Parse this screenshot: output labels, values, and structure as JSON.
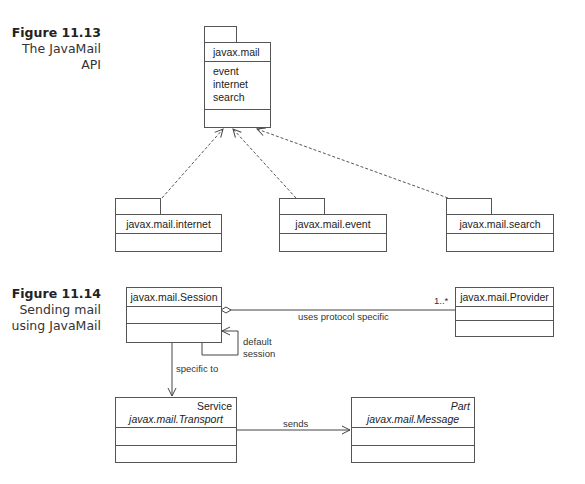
{
  "figures": [
    {
      "number": "Figure 11.13",
      "caption_lines": [
        "The JavaMail",
        "API"
      ],
      "main_package": {
        "name": "javax.mail",
        "contents": [
          "event",
          "internet",
          "search"
        ]
      },
      "sub_packages": [
        {
          "name": "javax.mail.internet"
        },
        {
          "name": "javax.mail.event"
        },
        {
          "name": "javax.mail.search"
        }
      ],
      "relationship": "dependency (dashed arrows from sub-packages to javax.mail)"
    },
    {
      "number": "Figure 11.14",
      "caption_lines": [
        "Sending mail",
        "using JavaMail"
      ],
      "classes": {
        "session": {
          "name": "javax.mail.Session"
        },
        "provider": {
          "name": "javax.mail.Provider"
        },
        "transport": {
          "stereotype": "Service",
          "name": "javax.mail.Transport"
        },
        "message": {
          "stereotype": "Part",
          "name": "javax.mail.Message"
        }
      },
      "associations": {
        "uses_label": "uses protocol specific",
        "uses_multiplicity": "1..*",
        "self_label_1": "default",
        "self_label_2": "session",
        "specific_label": "specific to",
        "sends_label": "sends"
      }
    }
  ]
}
